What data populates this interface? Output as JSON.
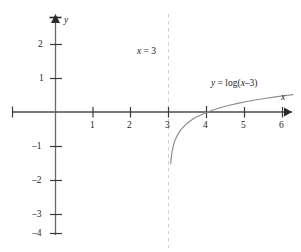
{
  "chart_data": {
    "type": "line",
    "title": "",
    "xlabel": "x",
    "ylabel": "y",
    "xlim": [
      -1.4,
      6.3
    ],
    "ylim": [
      -4.3,
      2.8
    ],
    "grid": false,
    "legend": "none",
    "function": "y = log(x-3)",
    "asymptote": {
      "type": "vertical",
      "x": 3,
      "label": "x = 3",
      "style": "dashed"
    },
    "x_ticks": [
      1,
      2,
      3,
      4,
      5,
      6
    ],
    "x_tick_labels": [
      "1",
      "2",
      "3",
      "4",
      "5",
      "6"
    ],
    "y_ticks": [
      2,
      1,
      -1,
      -2,
      -3,
      -4
    ],
    "y_tick_labels": [
      "2",
      "1",
      "–1",
      "–2",
      "–3",
      "–4"
    ],
    "x_intercept": [
      4,
      0
    ],
    "series": [
      {
        "name": "y = log(x–3)",
        "x": [
          3.03,
          3.05,
          3.07,
          3.1,
          3.14,
          3.18,
          3.24,
          3.3,
          3.4,
          3.5,
          3.6,
          3.7,
          3.8,
          3.9,
          4.0,
          4.2,
          4.4,
          4.6,
          4.8,
          5.0,
          5.25,
          5.5,
          5.75,
          6.0,
          6.25
        ],
        "y": [
          -1.52,
          -1.3,
          -1.15,
          -1.0,
          -0.85,
          -0.74,
          -0.62,
          -0.52,
          -0.4,
          -0.3,
          -0.22,
          -0.15,
          -0.1,
          -0.05,
          0.0,
          0.079,
          0.146,
          0.204,
          0.255,
          0.301,
          0.352,
          0.398,
          0.439,
          0.477,
          0.511
        ]
      }
    ]
  },
  "labels": {
    "y_axis_name": "y",
    "x_axis_name": "x",
    "asymptote_text_var": "x",
    "asymptote_text_eq": " = 3",
    "curve_label_lhs": "y",
    "curve_label_eq": " = log(",
    "curve_label_arg": "x",
    "curve_label_tail": "–3)"
  }
}
